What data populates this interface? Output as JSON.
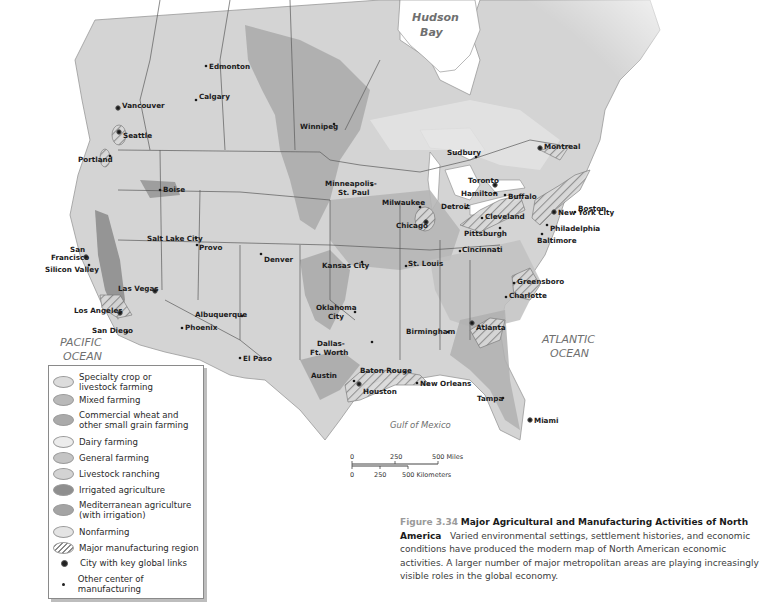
{
  "map": {
    "water_labels": {
      "hudson_bay": [
        "Hudson",
        "Bay"
      ],
      "pacific": [
        "PACIFIC",
        "OCEAN"
      ],
      "atlantic": [
        "ATLANTIC",
        "OCEAN"
      ],
      "gulf": "Gulf of Mexico"
    },
    "cities": [
      {
        "name": "Edmonton",
        "type": "other"
      },
      {
        "name": "Calgary",
        "type": "other"
      },
      {
        "name": "Vancouver",
        "type": "global"
      },
      {
        "name": "Seattle",
        "type": "global"
      },
      {
        "name": "Portland",
        "type": "other"
      },
      {
        "name": "Winnipeg",
        "type": "other"
      },
      {
        "name": "Boise",
        "type": "other"
      },
      {
        "name": "Minneapolis-",
        "type": "other"
      },
      {
        "name": "St. Paul",
        "type": "other"
      },
      {
        "name": "Sudbury",
        "type": "other"
      },
      {
        "name": "Montreal",
        "type": "global"
      },
      {
        "name": "Toronto",
        "type": "global"
      },
      {
        "name": "Hamilton",
        "type": "other"
      },
      {
        "name": "Buffalo",
        "type": "other"
      },
      {
        "name": "Boston",
        "type": "other"
      },
      {
        "name": "Milwaukee",
        "type": "other"
      },
      {
        "name": "Detroit",
        "type": "other"
      },
      {
        "name": "New York City",
        "type": "global"
      },
      {
        "name": "Cleveland",
        "type": "other"
      },
      {
        "name": "Chicago",
        "type": "global"
      },
      {
        "name": "Philadelphia",
        "type": "other"
      },
      {
        "name": "Pittsburgh",
        "type": "other"
      },
      {
        "name": "Baltimore",
        "type": "other"
      },
      {
        "name": "Salt Lake City",
        "type": "other"
      },
      {
        "name": "Provo",
        "type": "other"
      },
      {
        "name": "San",
        "type": "global"
      },
      {
        "name": "Francisco",
        "type": "global"
      },
      {
        "name": "Silicon Valley",
        "type": "other"
      },
      {
        "name": "Denver",
        "type": "other"
      },
      {
        "name": "Kansas City",
        "type": "other"
      },
      {
        "name": "St. Louis",
        "type": "other"
      },
      {
        "name": "Cincinnati",
        "type": "other"
      },
      {
        "name": "Las Vegas",
        "type": "global"
      },
      {
        "name": "Greensboro",
        "type": "other"
      },
      {
        "name": "Charlotte",
        "type": "other"
      },
      {
        "name": "Los Angeles",
        "type": "global"
      },
      {
        "name": "Albuquerque",
        "type": "other"
      },
      {
        "name": "Oklahoma",
        "type": "other"
      },
      {
        "name": "City",
        "type": "other"
      },
      {
        "name": "San Diego",
        "type": "other"
      },
      {
        "name": "Phoenix",
        "type": "other"
      },
      {
        "name": "Birmingham",
        "type": "other"
      },
      {
        "name": "Atlanta",
        "type": "global"
      },
      {
        "name": "El Paso",
        "type": "other"
      },
      {
        "name": "Dallas-",
        "type": "other"
      },
      {
        "name": "Ft. Worth",
        "type": "other"
      },
      {
        "name": "Austin",
        "type": "other"
      },
      {
        "name": "Baton Rouge",
        "type": "other"
      },
      {
        "name": "New Orleans",
        "type": "other"
      },
      {
        "name": "Houston",
        "type": "global"
      },
      {
        "name": "Tampa",
        "type": "other"
      },
      {
        "name": "Miami",
        "type": "global"
      }
    ]
  },
  "legend": {
    "items": [
      {
        "label": [
          "Specialty crop or",
          "livestock farming"
        ],
        "color": "#dcdcdc"
      },
      {
        "label": [
          "Mixed farming"
        ],
        "color": "#b9b9b9"
      },
      {
        "label": [
          "Commercial wheat and",
          "other small grain farming"
        ],
        "color": "#aaaaaa"
      },
      {
        "label": [
          "Dairy farming"
        ],
        "color": "#ececec"
      },
      {
        "label": [
          "General farming"
        ],
        "color": "#c4c4c4"
      },
      {
        "label": [
          "Livestock ranching"
        ],
        "color": "#d3d3d3"
      },
      {
        "label": [
          "Irrigated agriculture"
        ],
        "color": "#8e8e8e"
      },
      {
        "label": [
          "Mediterranean agriculture",
          "(with irrigation)"
        ],
        "color": "#a4a4a4"
      },
      {
        "label": [
          "Nonfarming"
        ],
        "color": "#e4e4e4"
      },
      {
        "label": [
          "Major manufacturing region"
        ],
        "color": "hatch"
      },
      {
        "label": [
          "City with key global links"
        ],
        "color": "dot-large"
      },
      {
        "label": [
          "Other center of manufacturing"
        ],
        "color": "dot-small"
      }
    ]
  },
  "scale_bar": {
    "miles": [
      "0",
      "250",
      "500 Miles"
    ],
    "kilometers": [
      "0",
      "250",
      "500 Kilometers"
    ]
  },
  "caption": {
    "figure_number": "Figure 3.34",
    "title": "Major Agricultural and Manufacturing Activities of North America",
    "body": "Varied environmental settings, settlement histories, and economic conditions have produced the modern map of North American economic activities. A larger number of major metropolitan areas are playing increasingly visible roles in the global economy."
  },
  "colors": {
    "land": "#d6d6d6",
    "water": "#ffffff",
    "border": "#555555",
    "wheat": "#a9a9a9",
    "general": "#c2c2c2",
    "irrigated": "#8f8f8f",
    "mixed": "#b8b8b8"
  }
}
